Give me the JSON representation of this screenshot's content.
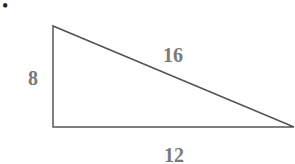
{
  "diagram": {
    "type": "right-triangle",
    "bullet": "•",
    "sides": {
      "vertical": "8",
      "hypotenuse": "16",
      "base": "12"
    },
    "colors": {
      "line": "#555555",
      "label": "#7a7a7a"
    }
  }
}
